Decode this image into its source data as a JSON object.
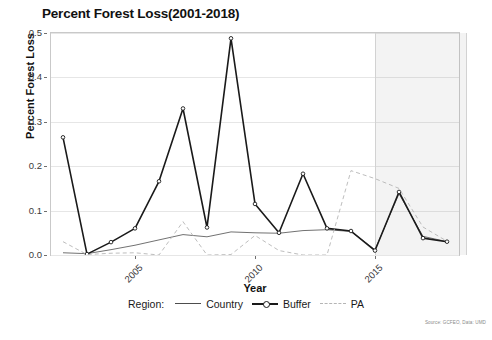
{
  "chart_data": {
    "type": "line",
    "title": "Percent Forest Loss(2001-2018)",
    "xlabel": "Year",
    "ylabel": "Percent Forest Loss",
    "x": [
      2002,
      2003,
      2004,
      2005,
      2006,
      2007,
      2008,
      2009,
      2010,
      2011,
      2012,
      2013,
      2014,
      2015,
      2016,
      2017,
      2018
    ],
    "xlim": [
      2001.5,
      2018.5
    ],
    "ylim": [
      0.0,
      0.5
    ],
    "yticks": [
      0.0,
      0.1,
      0.2,
      0.3,
      0.4,
      0.5
    ],
    "ytick_labels": [
      "0.0",
      "0.1",
      "0.2",
      "0.3",
      "0.4",
      "0.5"
    ],
    "xticks": [
      2005,
      2010,
      2015
    ],
    "xtick_labels": [
      "2005",
      "2010",
      "2015"
    ],
    "grid": true,
    "legend_position": "bottom",
    "legend_title": "Region:",
    "series": [
      {
        "name": "Country",
        "style": "solid",
        "color": "#4d4d4d",
        "width": 0.8,
        "marker": "none",
        "values": [
          0.005,
          0.003,
          0.012,
          0.022,
          0.034,
          0.046,
          0.041,
          0.052,
          0.05,
          0.049,
          0.055,
          0.057,
          0.053,
          0.012,
          0.138,
          0.042,
          0.03
        ]
      },
      {
        "name": "Buffer",
        "style": "solid",
        "color": "#1a1a1a",
        "width": 1.6,
        "marker": "circle",
        "values": [
          0.265,
          0.002,
          0.029,
          0.06,
          0.166,
          0.33,
          0.062,
          0.488,
          0.115,
          0.05,
          0.183,
          0.06,
          0.054,
          0.01,
          0.142,
          0.038,
          0.03
        ]
      },
      {
        "name": "PA",
        "style": "dashed",
        "color": "#b5b5b5",
        "width": 0.9,
        "marker": "none",
        "values": [
          0.03,
          0.001,
          0.004,
          0.005,
          0.0,
          0.075,
          0.0,
          0.001,
          0.044,
          0.01,
          0.0,
          0.0,
          0.19,
          0.172,
          0.15,
          0.063,
          0.031
        ]
      }
    ],
    "shaded_region": {
      "x_start": 2015.0,
      "x_end": 2018.75,
      "color": "#8c8c8c",
      "opacity": 0.1
    },
    "annotations": {
      "source": "Source: GCFEO, Data: UMD"
    }
  }
}
